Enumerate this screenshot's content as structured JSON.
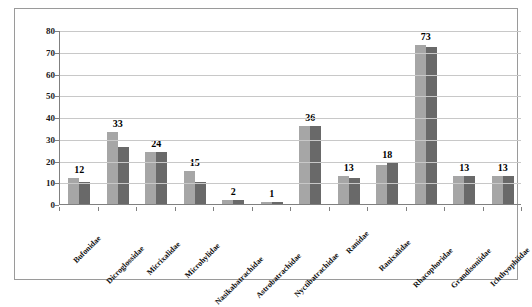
{
  "chart_data": {
    "type": "bar",
    "title": "",
    "xlabel": "",
    "ylabel": "",
    "ylim": [
      0,
      80
    ],
    "ytick_step": 10,
    "yticks": [
      0,
      10,
      20,
      30,
      40,
      50,
      60,
      70,
      80
    ],
    "grid": true,
    "legend_position": "none",
    "categories": [
      "Bufonidae",
      "Dicroglossidae",
      "Micrixalidae",
      "Microhylidae",
      "Nasikabatrachidae",
      "Astrobatrachidae",
      "Nyctibatrachidae",
      "Ranidae",
      "Ranixalidae",
      "Rhacophoridae",
      "Grandisoniidae",
      "Ichthyophiidae"
    ],
    "series": [
      {
        "name": "Series 1",
        "color": "#a6a6a6",
        "values": [
          12,
          33,
          24,
          15,
          2,
          1,
          36,
          13,
          18,
          73,
          13,
          13
        ]
      },
      {
        "name": "Series 2",
        "color": "#696969",
        "values": [
          10,
          26,
          24,
          10,
          2,
          1,
          36,
          12,
          19,
          72,
          13,
          13
        ]
      }
    ],
    "data_labels": [
      "12",
      "33",
      "24",
      "15",
      "2",
      "1",
      "36",
      "13",
      "18",
      "73",
      "13",
      "13"
    ]
  },
  "axes": {
    "y_tick_labels": [
      "80",
      "70",
      "60",
      "50",
      "40",
      "30",
      "20",
      "10",
      "0"
    ]
  },
  "colors": {
    "series1": "#a6a6a6",
    "series2": "#696969",
    "gridline": "#c8c8c8",
    "axis": "#808080",
    "frame": "#9a9a9a",
    "text": "#111111",
    "background": "#ffffff"
  }
}
